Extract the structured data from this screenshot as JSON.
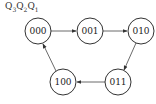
{
  "header": {
    "label": "Q3Q2Q1",
    "parts": [
      {
        "letter": "Q",
        "sub": "3"
      },
      {
        "letter": "Q",
        "sub": "2"
      },
      {
        "letter": "Q",
        "sub": "1"
      }
    ]
  },
  "diagram": {
    "type": "state-transition",
    "states": [
      {
        "id": "s000",
        "label": "000",
        "cx": 38,
        "cy": 31
      },
      {
        "id": "s001",
        "label": "001",
        "cx": 90,
        "cy": 31
      },
      {
        "id": "s010",
        "label": "010",
        "cx": 141,
        "cy": 31
      },
      {
        "id": "s011",
        "label": "011",
        "cx": 118,
        "cy": 82
      },
      {
        "id": "s100",
        "label": "100",
        "cx": 63,
        "cy": 82
      }
    ],
    "transitions": [
      {
        "from": "000",
        "to": "001"
      },
      {
        "from": "001",
        "to": "010"
      },
      {
        "from": "010",
        "to": "011"
      },
      {
        "from": "011",
        "to": "100"
      },
      {
        "from": "100",
        "to": "000"
      }
    ],
    "colors": {
      "stroke": "#333333",
      "text": "#222222",
      "background": "#ffffff"
    }
  }
}
